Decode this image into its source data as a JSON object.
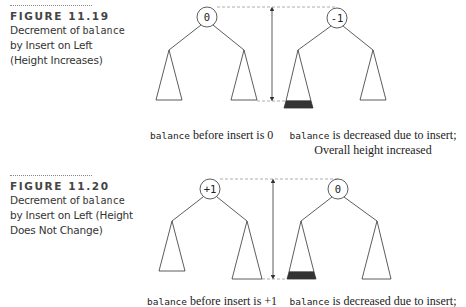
{
  "figures": [
    {
      "label": "FIGURE 11.19",
      "title_pre": "Decrement of ",
      "title_code": "balance",
      "title_lines": [
        "by Insert on Left",
        "(Height Increases)"
      ],
      "before": {
        "root_value": "0",
        "caption_code": "balance",
        "caption_text": " before insert is 0"
      },
      "after": {
        "root_value": "-1",
        "caption_code": "balance",
        "caption_text": " is decreased due to insert;",
        "caption_line2": "Overall height increased"
      }
    },
    {
      "label": "FIGURE 11.20",
      "title_pre": "Decrement of ",
      "title_code": "balance",
      "title_lines": [
        "by Insert on Left (Height",
        "Does Not Change)"
      ],
      "before": {
        "root_value": "+1",
        "caption_code": "balance",
        "caption_text": " before insert is +1"
      },
      "after": {
        "root_value": "0",
        "caption_code": "balance",
        "caption_text": " is decreased due to insert;"
      }
    }
  ],
  "colors": {
    "line": "#333333",
    "dashed": "#999999",
    "inserted_band": "#333333"
  }
}
